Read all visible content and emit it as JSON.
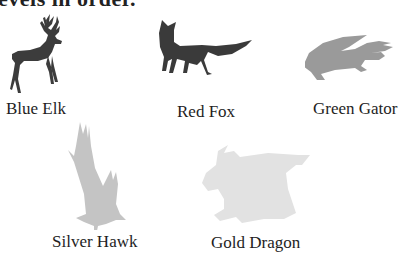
{
  "header": {
    "partial_text": "evels in order."
  },
  "animals": [
    {
      "id": "elk",
      "label": "Blue Elk",
      "shade": "#3c3c3c"
    },
    {
      "id": "fox",
      "label": "Red Fox",
      "shade": "#3a3a3a"
    },
    {
      "id": "gator",
      "label": "Green Gator",
      "shade": "#9a9a9a"
    },
    {
      "id": "hawk",
      "label": "Silver Hawk",
      "shade": "#c4c4c4"
    },
    {
      "id": "dragon",
      "label": "Gold Dragon",
      "shade": "#e2e2e2"
    }
  ]
}
